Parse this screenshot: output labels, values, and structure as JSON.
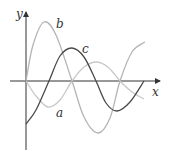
{
  "chart_data": {
    "type": "line",
    "title": "",
    "xlabel": "x",
    "ylabel": "y",
    "grid": false,
    "legend": "none (curves labeled inline)",
    "series": [
      {
        "name": "a",
        "color": "#c8c8c8",
        "description": "starts at origin, dips to a minimum, rises to a smaller maximum, then descends (function)",
        "points": [
          [
            26,
            81
          ],
          [
            36,
            96
          ],
          [
            48,
            107
          ],
          [
            60,
            100
          ],
          [
            72,
            81
          ],
          [
            84,
            67
          ],
          [
            97,
            62
          ],
          [
            109,
            68
          ],
          [
            120,
            81
          ],
          [
            132,
            92
          ],
          [
            144,
            99
          ]
        ]
      },
      {
        "name": "b",
        "color": "#b4b4b4",
        "description": "starts at origin, rises to a tall maximum, drops to a deep minimum, rises again (derivative of c)",
        "points": [
          [
            26,
            81
          ],
          [
            33,
            45
          ],
          [
            44,
            22
          ],
          [
            56,
            35
          ],
          [
            72,
            81
          ],
          [
            84,
            117
          ],
          [
            98,
            133
          ],
          [
            110,
            118
          ],
          [
            120,
            81
          ],
          [
            132,
            52
          ],
          [
            145,
            42
          ]
        ]
      },
      {
        "name": "c",
        "color": "#4a4a4a",
        "description": "starts below origin, rises to a maximum, falls to a minimum, returns to axis (derivative of a)",
        "points": [
          [
            26,
            124
          ],
          [
            36,
            110
          ],
          [
            49,
            81
          ],
          [
            60,
            56
          ],
          [
            72,
            48
          ],
          [
            84,
            57
          ],
          [
            96,
            81
          ],
          [
            106,
            103
          ],
          [
            117,
            111
          ],
          [
            130,
            102
          ],
          [
            144,
            81
          ]
        ]
      }
    ],
    "labels": [
      {
        "text": "a",
        "x": 56,
        "y": 116
      },
      {
        "text": "b",
        "x": 57,
        "y": 28
      },
      {
        "text": "c",
        "x": 82,
        "y": 53
      },
      {
        "text": "x",
        "x": 152,
        "y": 95
      },
      {
        "text": "y",
        "x": 16,
        "y": 18
      }
    ],
    "axes": {
      "origin": [
        26,
        81
      ],
      "x_axis": {
        "from": 10,
        "to": 160
      },
      "y_axis": {
        "from": 150,
        "to": 12
      }
    }
  },
  "labels": {
    "x_axis": "x",
    "y_axis": "y",
    "curve_a": "a",
    "curve_b": "b",
    "curve_c": "c"
  }
}
